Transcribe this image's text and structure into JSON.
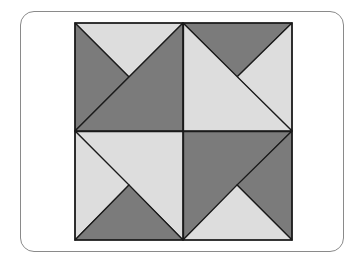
{
  "diagram": {
    "type": "quilt-block",
    "grid": "2x2",
    "colors": {
      "dark": "#7b7b7b",
      "light": "#dddddd",
      "stroke": "#1a1a1a",
      "frame": "#8a8a8a",
      "background": "#ffffff"
    },
    "square": {
      "x0": 75,
      "y0": 23,
      "x1": 292,
      "y1": 240
    },
    "quadrants": [
      {
        "name": "top-left",
        "pieces": [
          {
            "fill": "light",
            "points": "75,23 183,23 129,77"
          },
          {
            "fill": "dark",
            "points": "75,23 129,77 75,131"
          },
          {
            "fill": "dark",
            "points": "183,23 183,131 75,131"
          }
        ]
      },
      {
        "name": "top-right",
        "pieces": [
          {
            "fill": "dark",
            "points": "183,23 292,23 237,77"
          },
          {
            "fill": "light",
            "points": "292,23 292,131 237,77"
          },
          {
            "fill": "light",
            "points": "183,23 292,131 183,131"
          }
        ]
      },
      {
        "name": "bottom-left",
        "pieces": [
          {
            "fill": "light",
            "points": "75,131 183,131 183,240"
          },
          {
            "fill": "light",
            "points": "75,131 129,185 75,240"
          },
          {
            "fill": "dark",
            "points": "75,240 129,185 183,240"
          }
        ]
      },
      {
        "name": "bottom-right",
        "pieces": [
          {
            "fill": "dark",
            "points": "183,131 292,131 183,240"
          },
          {
            "fill": "dark",
            "points": "292,131 292,240 237,185"
          },
          {
            "fill": "light",
            "points": "183,240 237,185 292,240"
          }
        ]
      }
    ]
  }
}
